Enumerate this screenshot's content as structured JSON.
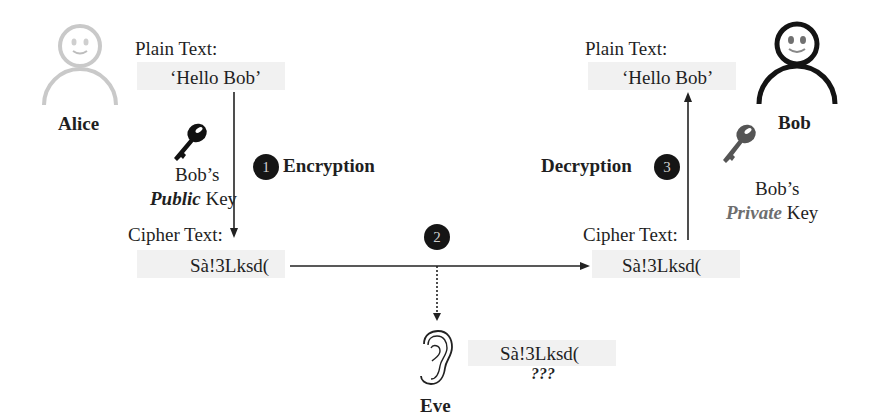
{
  "alice": {
    "name": "Alice",
    "plain_label": "Plain Text:",
    "plain_value": "‘Hello Bob’",
    "key_owner": "Bob’s",
    "key_type": "Public",
    "key_word": "Key",
    "cipher_label": "Cipher Text:",
    "cipher_value": "Sà!3Lksd("
  },
  "steps": [
    {
      "number": "1",
      "label": "Encryption"
    },
    {
      "number": "2",
      "label": ""
    },
    {
      "number": "3",
      "label": "Decryption"
    }
  ],
  "bob": {
    "name": "Bob",
    "plain_label": "Plain Text:",
    "plain_value": "‘Hello Bob’",
    "key_owner": "Bob’s",
    "key_type": "Private",
    "key_word": "Key",
    "cipher_label": "Cipher Text:",
    "cipher_value": "Sà!3Lksd("
  },
  "eve": {
    "name": "Eve",
    "intercepted_value": "Sà!3Lksd(",
    "unknown": "???"
  },
  "colors": {
    "alice_figure": "#c8c8c8",
    "bob_figure": "#141414",
    "step_circle": "#151515",
    "private_key": "#555555",
    "public_key": "#111111"
  }
}
